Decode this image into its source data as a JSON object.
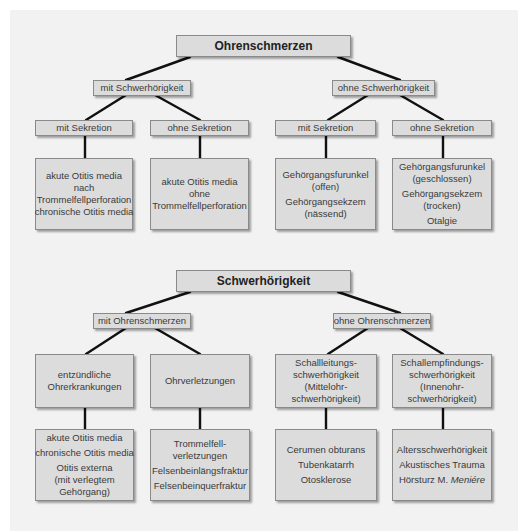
{
  "diagrams": [
    {
      "root": "Ohrenschmerzen",
      "branches": [
        {
          "label": "mit Schwerhörigkeit",
          "children": [
            {
              "label": "mit Sekretion",
              "leaf": [
                [
                  "akute Otitis media",
                  "nach",
                  "Trommelfellperforation"
                ],
                [
                  "chronische Otitis media"
                ]
              ]
            },
            {
              "label": "ohne Sekretion",
              "leaf": [
                [
                  "akute Otitis media",
                  "ohne",
                  "Trommelfellperforation"
                ]
              ]
            }
          ]
        },
        {
          "label": "ohne Schwerhörigkeit",
          "children": [
            {
              "label": "mit Sekretion",
              "leaf": [
                [
                  "Gehörgangsfurunkel",
                  "(offen)"
                ],
                [
                  "Gehörgangsekzem",
                  "(nässend)"
                ]
              ]
            },
            {
              "label": "ohne Sekretion",
              "leaf": [
                [
                  "Gehörgangsfurunkel",
                  "(geschlossen)"
                ],
                [
                  "Gehörgangsekzem",
                  "(trocken)"
                ],
                [
                  "Otalgie"
                ]
              ]
            }
          ]
        }
      ]
    },
    {
      "root": "Schwerhörigkeit",
      "branches": [
        {
          "label": "mit Ohrenschmerzen",
          "children": [
            {
              "label": [
                "entzündliche",
                "Ohrerkrankungen"
              ],
              "leaf": [
                [
                  "akute Otitis media"
                ],
                [
                  "chronische Otitis media"
                ],
                [
                  "Otitis externa",
                  "(mit verlegtem",
                  "Gehörgang)"
                ]
              ]
            },
            {
              "label": [
                "Ohrverletzungen"
              ],
              "leaf": [
                [
                  "Trommelfell-",
                  "verletzungen"
                ],
                [
                  "Felsenbeinlängsfraktur"
                ],
                [
                  "Felsenbeinquerfraktur"
                ]
              ]
            }
          ]
        },
        {
          "label": "ohne Ohrenschmerzen",
          "children": [
            {
              "label": [
                "Schallleitungs-",
                "schwerhörigkeit",
                "(Mittelohr-",
                "schwerhörigkeit)"
              ],
              "leaf": [
                [
                  "Cerumen obturans"
                ],
                [
                  "Tubenkatarrh"
                ],
                [
                  "Otosklerose"
                ]
              ]
            },
            {
              "label": [
                "Schallempfindungs-",
                "schwerhörigkeit",
                "(Innenohr-",
                "schwerhörigkeit)"
              ],
              "leaf": [
                [
                  "Altersschwerhörigkeit"
                ],
                [
                  "Akustisches Trauma"
                ],
                [
                  "Hörsturz M. ",
                  "Meniére"
                ]
              ]
            }
          ]
        }
      ]
    }
  ]
}
